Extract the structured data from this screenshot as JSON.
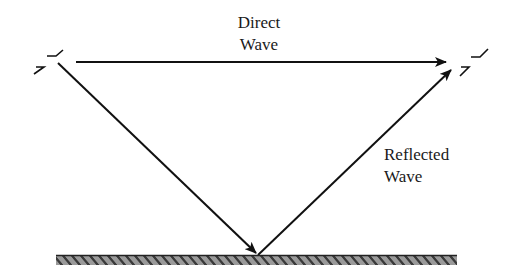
{
  "diagram": {
    "labels": {
      "direct_line1": "Direct",
      "direct_line2": "Wave",
      "reflected_line1": "Reflected",
      "reflected_line2": "Wave"
    },
    "nodes": [
      {
        "id": "transmitter",
        "type": "antenna",
        "x": 62,
        "y": 62
      },
      {
        "id": "receiver",
        "type": "antenna",
        "x": 472,
        "y": 63
      },
      {
        "id": "reflection-point",
        "type": "point",
        "x": 258,
        "y": 255
      },
      {
        "id": "ground",
        "type": "surface",
        "x_start": 56,
        "x_end": 457,
        "y": 255
      }
    ],
    "edges": [
      {
        "id": "direct-wave",
        "from": "transmitter",
        "to": "receiver",
        "label": "Direct Wave"
      },
      {
        "id": "incident-wave",
        "from": "transmitter",
        "to": "reflection-point"
      },
      {
        "id": "reflected-wave",
        "from": "reflection-point",
        "to": "receiver",
        "label": "Reflected Wave"
      }
    ],
    "colors": {
      "line": "#111111",
      "ground_fill": "#8a8a8a",
      "ground_hatch": "#2a2a2a"
    }
  }
}
